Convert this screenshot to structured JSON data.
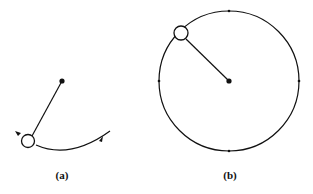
{
  "panels": {
    "a": {
      "label": "(a)"
    },
    "b": {
      "label": "(b)"
    }
  },
  "colors": {
    "stroke": "#111111",
    "background": "#ffffff"
  }
}
